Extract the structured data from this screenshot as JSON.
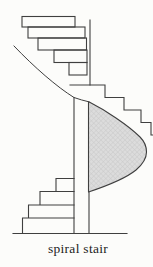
{
  "figure": {
    "caption": "spiral stair"
  },
  "colors": {
    "background": "#fcfcfa",
    "line": "#3f3f3f",
    "shade_fill": "#dcdcdc",
    "shade_hatch": "#c6c6c6",
    "ink": "#1c1c1c"
  }
}
